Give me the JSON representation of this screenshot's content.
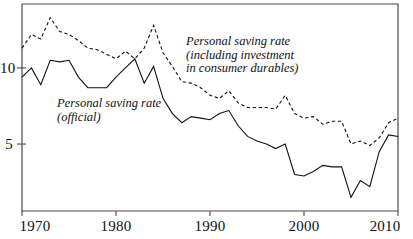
{
  "chart_data": {
    "type": "line",
    "title": "",
    "subtitle": "",
    "xlabel": "",
    "ylabel": "",
    "xlim": [
      1970,
      2010
    ],
    "ylim": [
      0.6,
      14.2
    ],
    "grid": false,
    "legend_position": "inline-annotations",
    "x_ticks": [
      "1970",
      "1980",
      "1990",
      "2000",
      "2010"
    ],
    "x_tick_values": [
      1970,
      1980,
      1990,
      2000,
      2010
    ],
    "y_ticks": [
      "5",
      "10"
    ],
    "y_tick_values": [
      5,
      10
    ],
    "x": [
      1970,
      1971,
      1972,
      1973,
      1974,
      1975,
      1976,
      1977,
      1978,
      1979,
      1980,
      1981,
      1982,
      1983,
      1984,
      1985,
      1986,
      1987,
      1988,
      1989,
      1990,
      1991,
      1992,
      1993,
      1994,
      1995,
      1996,
      1997,
      1998,
      1999,
      2000,
      2001,
      2002,
      2003,
      2004,
      2005,
      2006,
      2007,
      2008,
      2009,
      2010
    ],
    "series": [
      {
        "name": "Personal saving rate (official)",
        "style": "solid",
        "color": "#111111",
        "label_lines": [
          "Personal saving rate",
          "(official)"
        ],
        "values": [
          9.4,
          10.0,
          8.9,
          10.5,
          10.4,
          10.5,
          9.4,
          8.7,
          8.7,
          8.7,
          9.4,
          10.0,
          10.6,
          9.0,
          10.1,
          8.0,
          7.0,
          6.4,
          6.8,
          6.7,
          6.6,
          7.0,
          7.2,
          6.2,
          5.5,
          5.2,
          5.0,
          4.7,
          5.0,
          3.0,
          2.9,
          3.2,
          3.6,
          3.5,
          3.5,
          1.5,
          2.6,
          2.2,
          4.5,
          5.6,
          5.5
        ]
      },
      {
        "name": "Personal saving rate (including investment in consumer durables)",
        "style": "dashed",
        "color": "#111111",
        "label_lines": [
          "Personal saving rate",
          "(including investment",
          "in consumer durables)"
        ],
        "values": [
          11.3,
          12.2,
          11.9,
          13.3,
          12.4,
          12.2,
          11.8,
          11.3,
          11.2,
          10.9,
          10.6,
          11.1,
          10.6,
          11.3,
          12.8,
          11.0,
          10.1,
          9.1,
          9.0,
          8.7,
          8.2,
          8.0,
          8.5,
          7.7,
          7.4,
          7.4,
          7.4,
          7.3,
          8.2,
          7.0,
          6.7,
          6.8,
          6.3,
          6.5,
          6.5,
          5.0,
          5.2,
          4.9,
          5.4,
          6.4,
          6.7
        ]
      }
    ],
    "annotations": [
      {
        "id": "annotation-official",
        "text_lines": [
          "Personal saving rate",
          "(official)"
        ],
        "x_px": 57,
        "y_px": 97
      },
      {
        "id": "annotation-including-durables",
        "text_lines": [
          "Personal saving rate",
          "(including investment",
          "in consumer durables)"
        ],
        "x_px": 186,
        "y_px": 35
      }
    ]
  },
  "axes": {
    "frame_color": "#4a4a4a",
    "left_px": 22,
    "right_px": 398,
    "top_px": 4,
    "bottom_px": 211
  }
}
